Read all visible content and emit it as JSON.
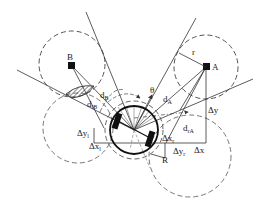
{
  "diagram": {
    "colors": {
      "stroke": "#222222",
      "dashed": "#555555",
      "fill": "#111111",
      "background": "#ffffff"
    },
    "obstacles": [
      {
        "id": "A",
        "label": "A"
      },
      {
        "id": "B",
        "label": "B"
      }
    ],
    "labels": {
      "r": "r",
      "theta": "θ",
      "dA": "d",
      "dA_sub": "A",
      "dB": "d",
      "dB_sub": "B",
      "dIB": "d",
      "dIB_sub": "lB",
      "drA": "d",
      "drA_sub": "rA",
      "dy": "Δy",
      "dx": "Δx",
      "dyl": "Δy",
      "dyl_sub": "l",
      "dxl": "Δx",
      "dxl_sub": "l",
      "dxr": "Δx",
      "dxr_sub": "r",
      "dyr": "Δy",
      "dyr_sub": "r",
      "R": "R"
    }
  }
}
